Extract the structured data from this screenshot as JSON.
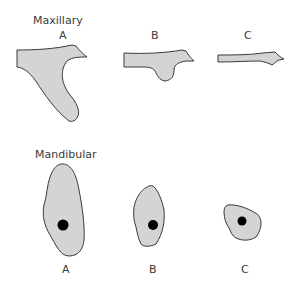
{
  "sections": {
    "maxillary": {
      "title": "Maxillary",
      "items": [
        {
          "label": "A"
        },
        {
          "label": "B"
        },
        {
          "label": "C"
        }
      ]
    },
    "mandibular": {
      "title": "Mandibular",
      "items": [
        {
          "label": "A"
        },
        {
          "label": "B"
        },
        {
          "label": "C"
        }
      ]
    }
  },
  "colors": {
    "fill": "#d4d4d4",
    "stroke": "#3a3a3a",
    "dot": "#000000"
  }
}
